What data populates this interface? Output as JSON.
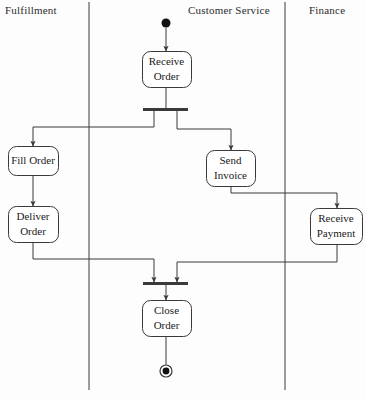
{
  "diagram": {
    "type": "uml-activity-diagram-with-swimlanes",
    "stroke_color": "#3a3a3a",
    "text_color": "#1a1a1a",
    "background_color": "#fdfdfd",
    "swimlanes": [
      {
        "id": "fulfillment",
        "label": "Fulfillment",
        "label_x": 5,
        "label_y": 4,
        "divider_x": 89
      },
      {
        "id": "customer-service",
        "label": "Customer Service",
        "label_x": 188,
        "label_y": 4,
        "divider_x": 285
      },
      {
        "id": "finance",
        "label": "Finance",
        "label_x": 309,
        "label_y": 4,
        "divider_x": null
      }
    ],
    "nodes": [
      {
        "id": "start",
        "kind": "initial-node",
        "label": "",
        "lane": "customer-service",
        "cx": 166,
        "cy": 23,
        "r": 4.5
      },
      {
        "id": "receive-order",
        "kind": "action",
        "label": "Receive\nOrder",
        "lane": "customer-service",
        "x": 142,
        "y": 51,
        "w": 49,
        "h": 36
      },
      {
        "id": "fork",
        "kind": "fork-bar",
        "label": "",
        "lane": "customer-service",
        "x": 143,
        "y": 108,
        "w": 45,
        "h": 3
      },
      {
        "id": "fill-order",
        "kind": "action",
        "label": "Fill Order",
        "lane": "fulfillment",
        "x": 8,
        "y": 146,
        "w": 50,
        "h": 29
      },
      {
        "id": "deliver-order",
        "kind": "action",
        "label": "Deliver\nOrder",
        "lane": "fulfillment",
        "x": 8,
        "y": 206,
        "w": 50,
        "h": 36
      },
      {
        "id": "send-invoice",
        "kind": "action",
        "label": "Send\nInvoice",
        "lane": "customer-service",
        "x": 206,
        "y": 150,
        "w": 49,
        "h": 36
      },
      {
        "id": "receive-payment",
        "kind": "action",
        "label": "Receive\nPayment",
        "lane": "finance",
        "x": 310,
        "y": 208,
        "w": 52,
        "h": 36
      },
      {
        "id": "join",
        "kind": "join-bar",
        "label": "",
        "lane": "customer-service",
        "x": 143,
        "y": 282,
        "w": 45,
        "h": 3
      },
      {
        "id": "close-order",
        "kind": "action",
        "label": "Close\nOrder",
        "lane": "customer-service",
        "x": 142,
        "y": 300,
        "w": 49,
        "h": 36
      },
      {
        "id": "end",
        "kind": "final-node",
        "label": "",
        "lane": "customer-service",
        "cx": 166,
        "cy": 371,
        "r": 6
      }
    ],
    "edges": [
      {
        "id": "start-to-receive-order",
        "from": "start",
        "to": "receive-order",
        "points": "166,28 166,51",
        "arrow": true
      },
      {
        "id": "receive-order-to-fork",
        "from": "receive-order",
        "to": "fork",
        "points": "166,87 166,108",
        "arrow": false
      },
      {
        "id": "fork-to-fill-order",
        "from": "fork",
        "to": "fill-order",
        "points": "154,111 154,127 33,127 33,146",
        "arrow": true
      },
      {
        "id": "fork-to-send-invoice",
        "from": "fork",
        "to": "send-invoice",
        "points": "177,111 177,129 231,129 231,150",
        "arrow": true
      },
      {
        "id": "fill-order-to-deliver-order",
        "from": "fill-order",
        "to": "deliver-order",
        "points": "33,175 33,206",
        "arrow": true
      },
      {
        "id": "send-invoice-to-receive-payment",
        "from": "send-invoice",
        "to": "receive-payment",
        "points": "231,186 231,193 337,193 337,208",
        "arrow": true
      },
      {
        "id": "deliver-order-to-join",
        "from": "deliver-order",
        "to": "join",
        "points": "33,242 33,259 154,259 154,282",
        "arrow": true
      },
      {
        "id": "receive-payment-to-join",
        "from": "receive-payment",
        "to": "join",
        "points": "337,244 337,262 177,262 177,282",
        "arrow": true
      },
      {
        "id": "join-to-close-order",
        "from": "join",
        "to": "close-order",
        "points": "166,285 166,300",
        "arrow": true
      },
      {
        "id": "close-order-to-end",
        "from": "close-order",
        "to": "end",
        "points": "166,336 166,365",
        "arrow": false
      }
    ]
  }
}
